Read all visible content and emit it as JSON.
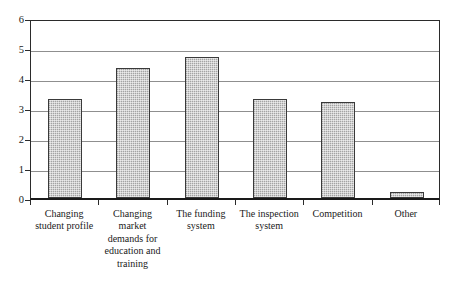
{
  "chart_data": {
    "type": "bar",
    "title": "",
    "subtitle": "",
    "xlabel": "",
    "ylabel": "",
    "ylim": [
      0,
      6
    ],
    "y_ticks": [
      "0",
      "1",
      "2",
      "3",
      "4",
      "5",
      "6"
    ],
    "grid": true,
    "legend": "none",
    "orientation": "vertical",
    "bar_color": "#bdbdbd",
    "bar_border_color": "#3a3a3a",
    "gridline_color": "#8f8f8f",
    "axis_color": "#1a1a1a",
    "categories": [
      "Changing student profile",
      "Changing market demands for education and training",
      "The funding system",
      "The inspection system",
      "Competition",
      "Other"
    ],
    "category_label_lines": [
      [
        "Changing",
        "student profile"
      ],
      [
        "Changing",
        "market",
        "demands for",
        "education and",
        "training"
      ],
      [
        "The funding",
        "system"
      ],
      [
        "The inspection",
        "system"
      ],
      [
        "Competition"
      ],
      [
        "Other"
      ]
    ],
    "values": [
      3.3,
      4.35,
      4.7,
      3.3,
      3.2,
      0.2
    ]
  }
}
